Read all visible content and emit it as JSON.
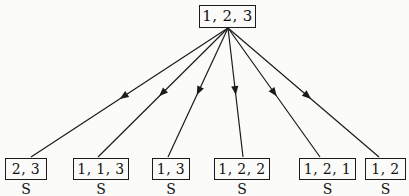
{
  "diagram": {
    "type": "tree",
    "title": "",
    "background_color": "#fbfbfa",
    "line_color": "#1b1b1b",
    "text_color": "#121212",
    "root": {
      "label": "1, 2, 3",
      "x": 199,
      "y": 5,
      "width": 57,
      "height": 23,
      "font_size": 15
    },
    "edge_origin": {
      "x": 228,
      "y": 28
    },
    "leaves": [
      {
        "label": "2, 3",
        "sublabel": "S",
        "x": 5,
        "y": 158,
        "width": 42,
        "height": 22,
        "font_size": 14,
        "edge_end_x": 31,
        "edge_end_y": 157,
        "arrow_t": 0.55
      },
      {
        "label": "1, 1, 3",
        "sublabel": "S",
        "x": 73,
        "y": 158,
        "width": 56,
        "height": 22,
        "font_size": 14,
        "edge_end_x": 98,
        "edge_end_y": 157,
        "arrow_t": 0.53
      },
      {
        "label": "1, 3",
        "sublabel": "S",
        "x": 152,
        "y": 158,
        "width": 38,
        "height": 22,
        "font_size": 14,
        "edge_end_x": 168,
        "edge_end_y": 157,
        "arrow_t": 0.52
      },
      {
        "label": "1, 2, 2",
        "sublabel": "S",
        "x": 214,
        "y": 158,
        "width": 56,
        "height": 22,
        "font_size": 14,
        "edge_end_x": 243,
        "edge_end_y": 157,
        "arrow_t": 0.52
      },
      {
        "label": "1, 2, 1",
        "sublabel": "S",
        "x": 299,
        "y": 158,
        "width": 57,
        "height": 22,
        "font_size": 14,
        "edge_end_x": 320,
        "edge_end_y": 157,
        "arrow_t": 0.53
      },
      {
        "label": "1, 2",
        "sublabel": "S",
        "x": 365,
        "y": 158,
        "width": 41,
        "height": 22,
        "font_size": 14,
        "edge_end_x": 379,
        "edge_end_y": 157,
        "arrow_t": 0.55
      }
    ]
  }
}
